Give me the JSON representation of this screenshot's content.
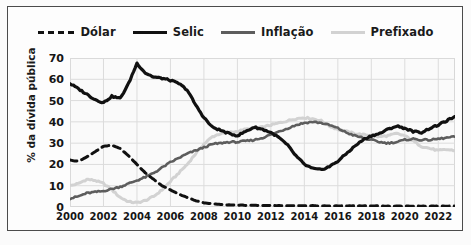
{
  "chart_data": {
    "type": "line",
    "title": "",
    "xlabel": "",
    "ylabel": "% da dívida pública",
    "xlim": [
      2000,
      2023
    ],
    "ylim": [
      0,
      70
    ],
    "grid": true,
    "legend_position": "top",
    "xticks": [
      "2000",
      "2002",
      "2004",
      "2006",
      "2008",
      "2010",
      "2012",
      "2014",
      "2016",
      "2018",
      "2020",
      "2022"
    ],
    "yticks": [
      "0",
      "10",
      "20",
      "30",
      "40",
      "50",
      "60",
      "70"
    ],
    "x": [
      2000.0,
      2000.5,
      2001.0,
      2001.5,
      2002.0,
      2002.5,
      2003.0,
      2003.5,
      2004.0,
      2004.5,
      2005.0,
      2005.5,
      2006.0,
      2006.5,
      2007.0,
      2007.5,
      2008.0,
      2008.5,
      2009.0,
      2009.5,
      2010.0,
      2010.5,
      2011.0,
      2011.5,
      2012.0,
      2012.5,
      2013.0,
      2013.5,
      2014.0,
      2014.5,
      2015.0,
      2015.5,
      2016.0,
      2016.5,
      2017.0,
      2017.5,
      2018.0,
      2018.5,
      2019.0,
      2019.5,
      2020.0,
      2020.5,
      2021.0,
      2021.5,
      2022.0,
      2022.5,
      2023.0
    ],
    "series": [
      {
        "name": "Dólar",
        "color": "#111111",
        "style": "dashed",
        "width": 3.0,
        "values": [
          22.0,
          21.5,
          23.5,
          26.0,
          28.5,
          29.0,
          27.5,
          24.0,
          20.0,
          16.0,
          13.0,
          10.0,
          8.0,
          6.0,
          4.5,
          3.0,
          2.0,
          1.5,
          1.2,
          1.0,
          0.9,
          0.8,
          0.8,
          0.7,
          0.7,
          0.7,
          0.6,
          0.6,
          0.6,
          0.6,
          0.5,
          0.5,
          0.5,
          0.5,
          0.5,
          0.5,
          0.5,
          0.5,
          0.4,
          0.4,
          0.4,
          0.4,
          0.4,
          0.4,
          0.4,
          0.4,
          0.4
        ]
      },
      {
        "name": "Selic",
        "color": "#111111",
        "style": "solid",
        "width": 3.2,
        "values": [
          58.0,
          55.5,
          53.0,
          50.5,
          49.0,
          52.0,
          51.0,
          58.0,
          67.5,
          63.0,
          61.0,
          60.5,
          59.5,
          58.0,
          55.0,
          48.0,
          42.0,
          37.5,
          36.0,
          34.5,
          33.5,
          35.5,
          37.5,
          36.5,
          35.0,
          32.5,
          29.0,
          24.0,
          20.0,
          18.0,
          17.5,
          19.0,
          21.5,
          25.0,
          28.5,
          31.5,
          33.5,
          34.5,
          36.5,
          38.0,
          37.0,
          35.5,
          35.0,
          37.0,
          38.5,
          40.5,
          42.5
        ]
      },
      {
        "name": "Inflação",
        "color": "#5d5d5d",
        "style": "solid",
        "width": 2.6,
        "values": [
          4.0,
          5.0,
          6.5,
          7.0,
          7.5,
          8.5,
          9.5,
          11.0,
          12.5,
          14.0,
          16.0,
          18.5,
          21.0,
          23.0,
          25.0,
          26.5,
          28.0,
          29.5,
          30.0,
          30.5,
          30.5,
          31.0,
          31.5,
          32.5,
          34.0,
          35.5,
          37.0,
          38.5,
          39.5,
          40.0,
          39.5,
          38.5,
          37.0,
          35.0,
          33.5,
          32.5,
          31.5,
          30.5,
          30.0,
          30.5,
          31.5,
          32.0,
          31.5,
          31.5,
          32.0,
          32.5,
          33.0
        ]
      },
      {
        "name": "Prefixado",
        "color": "#d2d2d2",
        "style": "solid",
        "width": 3.0,
        "values": [
          10.0,
          11.0,
          13.0,
          12.5,
          11.0,
          8.0,
          4.5,
          2.5,
          2.0,
          3.0,
          5.0,
          8.0,
          12.0,
          16.0,
          20.0,
          25.0,
          29.5,
          33.0,
          34.5,
          35.0,
          35.5,
          36.5,
          37.0,
          37.5,
          38.5,
          39.5,
          40.5,
          41.5,
          42.0,
          41.5,
          40.5,
          38.0,
          36.5,
          35.5,
          34.5,
          34.0,
          33.5,
          33.0,
          33.5,
          34.5,
          33.5,
          31.0,
          28.5,
          27.5,
          26.5,
          27.0,
          26.5
        ]
      }
    ]
  },
  "legend": {
    "items": [
      {
        "label": "Dólar"
      },
      {
        "label": "Selic"
      },
      {
        "label": "Inflação"
      },
      {
        "label": "Prefixado"
      }
    ]
  },
  "axes": {
    "ylabel": "% da dívida pública"
  }
}
